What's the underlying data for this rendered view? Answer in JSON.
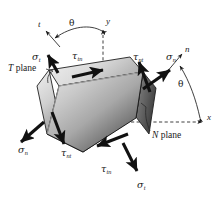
{
  "figure": {
    "background_color": "#ffffff",
    "ink_color": "#1a1a1a"
  },
  "axes": {
    "x_label": "x",
    "y_label": "y",
    "n_label": "n",
    "t_label": "t",
    "angle_label_right": "θ",
    "angle_label_left": "θ",
    "style": "dashed"
  },
  "planes": {
    "t_plane": {
      "name": "T",
      "suffix": "plane"
    },
    "n_plane": {
      "name": "N",
      "suffix": "plane"
    }
  },
  "stresses": {
    "sigma": "σ",
    "tau": "τ",
    "top_left_normal": {
      "symbol": "σ",
      "subscript": "t"
    },
    "top_left_shear": {
      "symbol": "τ",
      "subscript": "tn"
    },
    "top_right_shear": {
      "symbol": "τ",
      "subscript": "nt"
    },
    "right_normal": {
      "symbol": "σ",
      "subscript": "n"
    },
    "bottom_left_normal": {
      "symbol": "σ",
      "subscript": "n"
    },
    "bottom_left_shear": {
      "symbol": "τ",
      "subscript": "nt"
    },
    "bottom_shear": {
      "symbol": "τ",
      "subscript": "tn"
    },
    "bottom_normal": {
      "symbol": "σ",
      "subscript": "t"
    }
  },
  "block": {
    "face_light": "#d4d4d4",
    "face_dark": "#4a4a4a",
    "edge_light": "#e6e6e6",
    "edge_mid": "#9a9a9a",
    "outline": "#1f1f1f"
  }
}
